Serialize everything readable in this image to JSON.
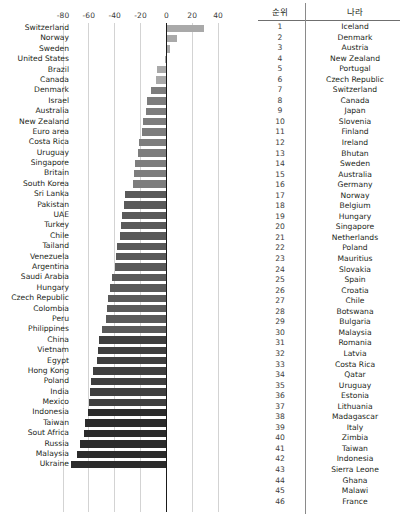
{
  "chart_data": {
    "type": "bar",
    "orientation": "horizontal",
    "title": "",
    "xlabel": "",
    "ylabel": "",
    "xlim": [
      -90,
      47
    ],
    "xticks": [
      -80,
      -60,
      -40,
      -20,
      0,
      20,
      40
    ],
    "xtick_labels": [
      "-80",
      "-60",
      "-40",
      "-20",
      "0",
      "20",
      "40"
    ],
    "grid": true,
    "legend": "none",
    "categories": [
      "Switzerland",
      "Norway",
      "Sweden",
      "United States",
      "Brazil",
      "Canada",
      "Denmark",
      "Israel",
      "Australia",
      "New Zealand",
      "Euro area",
      "Costa Rica",
      "Uruguay",
      "Singapore",
      "Britain",
      "South Korea",
      "Sri Lanka",
      "Pakistan",
      "UAE",
      "Turkey",
      "Chile",
      "Tailand",
      "Venezuela",
      "Argentina",
      "Saudi Arabia",
      "Hungary",
      "Czech Republic",
      "Colombia",
      "Peru",
      "Philippines",
      "China",
      "Vietnam",
      "Egypt",
      "Hong Kong",
      "Poland",
      "India",
      "Mexico",
      "Indonesia",
      "Taiwan",
      "Sout Africa",
      "Russia",
      "Malaysia",
      "Ukraine"
    ],
    "values": [
      29,
      8,
      3,
      -1,
      -7,
      -8,
      -12,
      -15,
      -16,
      -18,
      -19,
      -21,
      -22,
      -24,
      -25,
      -26,
      -32,
      -33,
      -34,
      -35,
      -36,
      -38,
      -39,
      -40,
      -42,
      -44,
      -45,
      -46,
      -47,
      -50,
      -52,
      -53,
      -54,
      -57,
      -58,
      -59,
      -60,
      -61,
      -63,
      -64,
      -67,
      -69,
      -74
    ]
  },
  "table": {
    "headers": {
      "rank": "순위",
      "country": "나라"
    },
    "rows": [
      {
        "rank": "1",
        "country": "Iceland"
      },
      {
        "rank": "2",
        "country": "Denmark"
      },
      {
        "rank": "3",
        "country": "Austria"
      },
      {
        "rank": "4",
        "country": "New Zealand"
      },
      {
        "rank": "5",
        "country": "Portugal"
      },
      {
        "rank": "6",
        "country": "Czech Republic"
      },
      {
        "rank": "7",
        "country": "Switzerland"
      },
      {
        "rank": "8",
        "country": "Canada"
      },
      {
        "rank": "9",
        "country": "Japan"
      },
      {
        "rank": "10",
        "country": "Slovenia"
      },
      {
        "rank": "11",
        "country": "Finland"
      },
      {
        "rank": "12",
        "country": "Ireland"
      },
      {
        "rank": "13",
        "country": "Bhutan"
      },
      {
        "rank": "14",
        "country": "Sweden"
      },
      {
        "rank": "15",
        "country": "Australia"
      },
      {
        "rank": "16",
        "country": "Germany"
      },
      {
        "rank": "17",
        "country": "Norway"
      },
      {
        "rank": "18",
        "country": "Belgium"
      },
      {
        "rank": "19",
        "country": "Hungary"
      },
      {
        "rank": "20",
        "country": "Singapore"
      },
      {
        "rank": "21",
        "country": "Netherlands"
      },
      {
        "rank": "22",
        "country": "Poland"
      },
      {
        "rank": "23",
        "country": "Mauritius"
      },
      {
        "rank": "24",
        "country": "Slovakia"
      },
      {
        "rank": "25",
        "country": "Spain"
      },
      {
        "rank": "26",
        "country": "Croatia"
      },
      {
        "rank": "27",
        "country": "Chile"
      },
      {
        "rank": "28",
        "country": "Botswana"
      },
      {
        "rank": "29",
        "country": "Bulgaria"
      },
      {
        "rank": "30",
        "country": "Malaysia"
      },
      {
        "rank": "31",
        "country": "Romania"
      },
      {
        "rank": "32",
        "country": "Latvia"
      },
      {
        "rank": "33",
        "country": "Costa Rica"
      },
      {
        "rank": "34",
        "country": "Qatar"
      },
      {
        "rank": "35",
        "country": "Uruguay"
      },
      {
        "rank": "36",
        "country": "Estonia"
      },
      {
        "rank": "37",
        "country": "Lithuania"
      },
      {
        "rank": "38",
        "country": "Madagascar"
      },
      {
        "rank": "39",
        "country": "Italy"
      },
      {
        "rank": "40",
        "country": "Zimbia"
      },
      {
        "rank": "41",
        "country": "Taiwan"
      },
      {
        "rank": "42",
        "country": "Indonesia"
      },
      {
        "rank": "43",
        "country": "Sierra Leone"
      },
      {
        "rank": "44",
        "country": "Ghana"
      },
      {
        "rank": "45",
        "country": "Malawi"
      },
      {
        "rank": "46",
        "country": "France"
      }
    ]
  },
  "colors": {
    "bar_light": "#a9a9a9",
    "bar_mid": "#7d7d7d",
    "bar_dark": "#3f3f3f",
    "bar_darkest": "#2b2b2b",
    "gridline": "#d3d3d3",
    "zero_line": "#1a1a1a",
    "text": "#231f20"
  }
}
